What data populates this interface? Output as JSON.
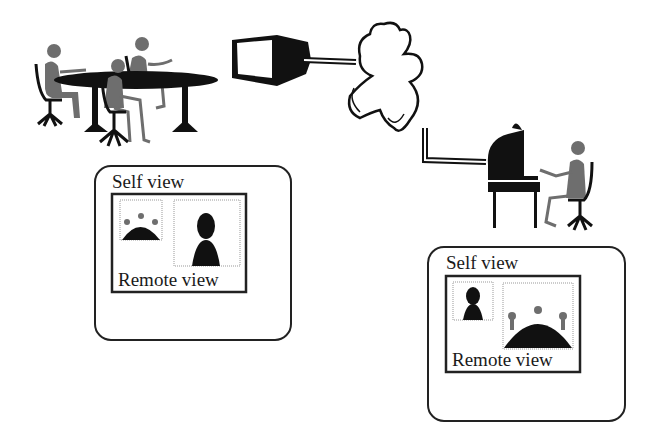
{
  "diagram": {
    "nodes": {
      "conference_room": {
        "description": "Group of people seated around an oval conference table"
      },
      "room_monitor": {
        "description": "Video monitor / camera unit"
      },
      "network_cloud": {
        "description": "Network cloud"
      },
      "desktop_user": {
        "description": "Single person at a desk with a computer"
      }
    },
    "edges": [
      {
        "from": "room_monitor",
        "to": "network_cloud"
      },
      {
        "from": "network_cloud",
        "to": "desktop_user"
      }
    ],
    "screens": [
      {
        "id": "room-screen",
        "self_view_label": "Self view",
        "remote_view_label": "Remote view",
        "self_content": "group",
        "remote_content": "single person"
      },
      {
        "id": "desktop-screen",
        "self_view_label": "Self view",
        "remote_view_label": "Remote view",
        "self_content": "single person",
        "remote_content": "group"
      }
    ],
    "colors": {
      "ink": "#111111",
      "person": "#6e6e6e",
      "paper": "#ffffff",
      "dotted": "#9a9a9a"
    }
  }
}
